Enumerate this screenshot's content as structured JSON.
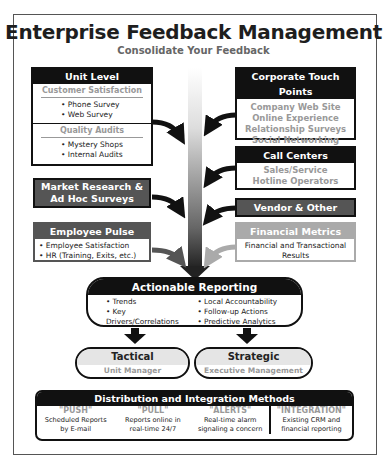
{
  "title": "Enterprise Feedback Management",
  "subtitle": "Consolidate Your Feedback",
  "left": {
    "unit_level": {
      "header": "Unit Level",
      "sections": [
        {
          "title": "Customer Satisfaction",
          "items": [
            "• Phone Survey",
            "• Web Survey"
          ]
        },
        {
          "title": "Quality Audits",
          "items": [
            "• Mystery Shops",
            "• Internal Audits"
          ]
        }
      ]
    },
    "market_research": {
      "header_line1": "Market Research &",
      "header_line2": "Ad Hoc Surveys"
    },
    "employee_pulse": {
      "header": "Employee Pulse",
      "items": [
        "• Employee Satisfaction",
        "• HR (Training, Exits, etc.)"
      ]
    }
  },
  "right": {
    "corporate": {
      "header": "Corporate Touch Points",
      "items": [
        "Company Web Site",
        "Online Experience",
        "Relationship Surveys",
        "Social Networking"
      ]
    },
    "call_centers": {
      "header": "Call Centers",
      "items": [
        "Sales/Service",
        "Hotline Operators"
      ]
    },
    "vendor": {
      "header": "Vendor & Other"
    },
    "financial": {
      "header": "Financial Metrics",
      "items": [
        "Financial and Transactional",
        "Results"
      ]
    }
  },
  "reporting": {
    "header": "Actionable Reporting",
    "left_items": [
      "• Trends",
      "• Key Drivers/Correlations",
      "• Alerts"
    ],
    "right_items": [
      "• Local Accountability",
      "• Follow-up Actions",
      "• Predictive Analytics"
    ]
  },
  "tactical": {
    "title": "Tactical",
    "subtitle": "Unit Manager"
  },
  "strategic": {
    "title": "Strategic",
    "subtitle": "Executive Management"
  },
  "distribution": {
    "header": "Distribution and Integration Methods",
    "methods": [
      {
        "name": "\"PUSH\"",
        "line1": "Scheduled Reports",
        "line2": "by E-mail"
      },
      {
        "name": "\"PULL\"",
        "line1": "Reports online in",
        "line2": "real-time 24/7"
      },
      {
        "name": "\"ALERTS\"",
        "line1": "Real-time alarm",
        "line2": "signaling a concern"
      },
      {
        "name": "\"INTEGRATION\"",
        "line1": "Existing CRM and",
        "line2": "financial reporting"
      }
    ]
  },
  "colors": {
    "black": "#111111",
    "dark_grey": "#555555",
    "light_grey": "#aaaaaa",
    "text_grey": "#999999"
  }
}
